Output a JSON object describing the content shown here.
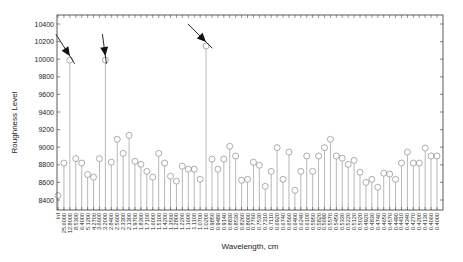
{
  "chart_data": {
    "type": "stem",
    "title": "",
    "xlabel": "Wavelength, cm",
    "ylabel": "Roughness Level",
    "ylim": [
      8300,
      10500
    ],
    "yticks": [
      8400,
      8600,
      8800,
      9000,
      9200,
      9400,
      9600,
      9800,
      10000,
      10200,
      10400
    ],
    "grid": false,
    "legend": null,
    "categories": [
      "Inf",
      "25.6000",
      "12.8000",
      "8.5300",
      "6.4000",
      "5.1200",
      "4.2700",
      "3.6600",
      "3.2000",
      "2.8400",
      "2.5600",
      "2.3300",
      "2.1300",
      "1.9700",
      "1.8300",
      "1.7100",
      "1.6000",
      "1.5100",
      "1.4200",
      "1.3500",
      "1.2800",
      "1.2200",
      "1.1600",
      "1.1100",
      "1.0700",
      "1.0200",
      "0.9850",
      "0.9480",
      "0.9140",
      "0.8830",
      "0.8530",
      "0.8260",
      "0.8000",
      "0.7760",
      "0.7530",
      "0.7310",
      "0.7110",
      "0.6920",
      "0.6740",
      "0.6560",
      "0.6400",
      "0.6240",
      "0.6100",
      "0.5950",
      "0.5820",
      "0.5690",
      "0.5570",
      "0.5450",
      "0.5330",
      "0.5220",
      "0.5120",
      "0.5020",
      "0.4920",
      "0.4830",
      "0.4740",
      "0.4650",
      "0.4570",
      "0.4490",
      "0.4410",
      "0.4340",
      "0.4270",
      "0.4200",
      "0.4130",
      "0.4060",
      "0.4000"
    ],
    "values": [
      8450,
      8820,
      9990,
      8870,
      8820,
      8690,
      8660,
      8870,
      9990,
      8830,
      9090,
      8930,
      9135,
      8840,
      8805,
      8725,
      8660,
      8930,
      8820,
      8670,
      8615,
      8785,
      8750,
      8750,
      8635,
      10150,
      8865,
      8750,
      8865,
      9010,
      8900,
      8625,
      8635,
      8830,
      8795,
      8555,
      8725,
      8995,
      8635,
      8945,
      8510,
      8725,
      8900,
      8725,
      8900,
      8995,
      9090,
      8900,
      8875,
      8805,
      8850,
      8715,
      8600,
      8635,
      8545,
      8705,
      8695,
      8635,
      8820,
      8945,
      8820,
      8820,
      8990,
      8900,
      8900
    ],
    "annotations": [
      {
        "type": "arrow",
        "target_index": 2,
        "label": ""
      },
      {
        "type": "arrow",
        "target_index": 8,
        "label": ""
      },
      {
        "type": "arrow",
        "target_index": 25,
        "label": ""
      }
    ]
  },
  "layout": {
    "plot": {
      "left": 57,
      "right": 443,
      "top": 15,
      "bottom": 210
    },
    "y_pixel": {
      "v1": 10400,
      "p1": 24,
      "v2": 8400,
      "p2": 200
    },
    "colors": {
      "stem": "#9a9a9a",
      "marker": "#8a8a8a",
      "axis": "#333333",
      "arrow": "#111111"
    }
  }
}
